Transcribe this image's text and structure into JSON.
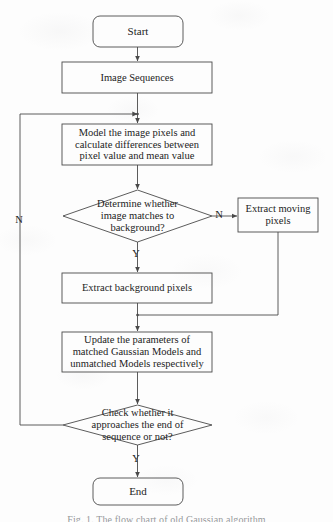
{
  "figure": {
    "caption": "Fig. 1. The flow chart of old Gaussian algorithm",
    "background_color": "#fdfdfd",
    "line_color": "#4a4a4a",
    "text_color": "#232323"
  },
  "nodes": [
    {
      "id": "start",
      "type": "terminal",
      "label": "Start",
      "x": 93,
      "y": 16,
      "w": 90,
      "h": 31
    },
    {
      "id": "image-sequences",
      "type": "process",
      "label": "Image Sequences",
      "x": 62,
      "y": 62,
      "w": 150,
      "h": 31
    },
    {
      "id": "model-pixels",
      "type": "process",
      "label": "Model the image pixels and\ncalculate differences between\npixel value and mean value",
      "x": 62,
      "y": 124,
      "w": 150,
      "h": 41
    },
    {
      "id": "match-background",
      "type": "decision",
      "label": "Determine whether\nimage matches to\nbackground?",
      "x": 63,
      "y": 190,
      "w": 149,
      "h": 52
    },
    {
      "id": "extract-moving",
      "type": "process",
      "label": "Extract moving\npixels",
      "x": 238,
      "y": 198,
      "w": 80,
      "h": 34
    },
    {
      "id": "extract-background",
      "type": "process",
      "label": "Extract background pixels",
      "x": 62,
      "y": 273,
      "w": 150,
      "h": 30
    },
    {
      "id": "update-parameters",
      "type": "process",
      "label": "Update the parameters of\nmatched Gaussian Models and\nunmatched Models respectively",
      "x": 62,
      "y": 332,
      "w": 150,
      "h": 40
    },
    {
      "id": "check-end-of-sequence",
      "type": "decision",
      "label": "Check whether it\napproaches the end of\nsequence or not?",
      "x": 63,
      "y": 405,
      "w": 149,
      "h": 40
    },
    {
      "id": "end",
      "type": "terminal",
      "label": "End",
      "x": 93,
      "y": 478,
      "w": 90,
      "h": 27
    }
  ],
  "edge_labels": [
    {
      "id": "no-match-branch",
      "text": "N",
      "x": 213,
      "y": 210
    },
    {
      "id": "yes-match-branch",
      "text": "Y",
      "x": 130,
      "y": 250
    },
    {
      "id": "no-end-branch",
      "text": "N",
      "x": 13,
      "y": 215
    },
    {
      "id": "yes-end-branch",
      "text": "Y",
      "x": 130,
      "y": 455
    }
  ]
}
